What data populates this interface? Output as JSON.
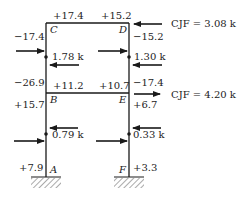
{
  "diagram": {
    "type": "portal-frame-moment-distribution",
    "nodes": {
      "A": "A",
      "B": "B",
      "C": "C",
      "D": "D",
      "E": "E",
      "F": "F"
    },
    "top_beam": {
      "left_moment": "+17.4",
      "right_moment": "+15.2"
    },
    "middle_beam": {
      "left_moment": "+11.2",
      "right_moment": "+10.7"
    },
    "left_column": {
      "top_moment": "−17.4",
      "upper_bottom_moment": "−26.9",
      "lower_top_moment": "+15.7",
      "base_moment": "+7.9",
      "upper_shear": "1.78 k",
      "lower_shear": "0.79 k"
    },
    "right_column": {
      "top_moment": "−15.2",
      "upper_bottom_moment": "−17.4",
      "lower_top_moment": "+6.7",
      "base_moment": "+3.3",
      "upper_shear": "1.30 k",
      "lower_shear": "0.33 k"
    },
    "loads": {
      "top": "CJF = 3.08 k",
      "middle": "CJF = 4.20 k"
    },
    "colors": {
      "line": "#1a1a1a",
      "text": "#222222"
    }
  }
}
